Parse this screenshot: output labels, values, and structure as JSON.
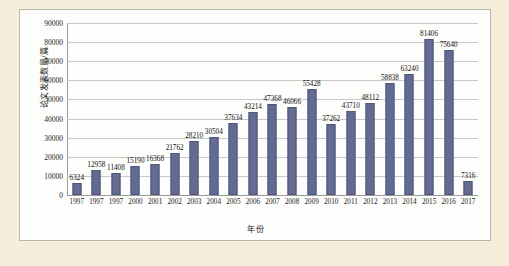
{
  "chart_data": {
    "type": "bar",
    "title": "",
    "xlabel": "年份",
    "ylabel": "论文发表数量/篇",
    "ylim": [
      0,
      90000
    ],
    "ytick_step": 10000,
    "yticks": [
      "0",
      "10000",
      "20000",
      "30000",
      "40000",
      "50000",
      "60000",
      "70000",
      "80000",
      "90000"
    ],
    "grid": true,
    "legend": "none",
    "bar_color": "#636b93",
    "panel_background": "#fdfdfb",
    "figure_background": "#f4eedb",
    "categories": [
      "1997",
      "1997",
      "1997",
      "2000",
      "2001",
      "2002",
      "2003",
      "2004",
      "2005",
      "2006",
      "2007",
      "2008",
      "2009",
      "2010",
      "2011",
      "2012",
      "2013",
      "2014",
      "2015",
      "2016",
      "2017"
    ],
    "values": [
      6324,
      12958,
      11408,
      15190,
      16368,
      21762,
      28210,
      30504,
      37634,
      43214,
      47368,
      46066,
      55428,
      37262,
      43710,
      48112,
      58838,
      63240,
      81406,
      75640,
      7316
    ],
    "value_labels": [
      "6324",
      "12958",
      "11408",
      "15190",
      "16368",
      "21762",
      "28210",
      "30504",
      "37634",
      "43214",
      "47368",
      "46066",
      "55428",
      "37262",
      "43710",
      "48112",
      "58838",
      "63240",
      "81406",
      "75640",
      "7316"
    ]
  }
}
